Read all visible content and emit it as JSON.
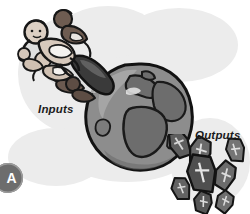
{
  "figure": {
    "panel_letter": "A",
    "background_color": "#ffffff",
    "backdrop_color": "#ececec"
  },
  "labels": {
    "inputs": "Inputs",
    "outputs": "Outputs"
  },
  "diagram": {
    "concept": "population input-output model",
    "input_icon": "babies-sliding-chute-icon",
    "center_icon": "globe-earth-icon",
    "output_icon": "coffins-icon",
    "colors": {
      "globe_ocean": "#8a8a8a",
      "globe_land": "#6f6f6f",
      "outline": "#1a1a1a",
      "coffin_fill": "#5f5f5f",
      "badge_fill": "#6d6d6d",
      "badge_text": "#ffffff",
      "label_text": "#1b1b1b",
      "skin_light": "#d8cbc0",
      "skin_dark": "#6b5a50",
      "diaper": "#f2f0ee"
    }
  }
}
